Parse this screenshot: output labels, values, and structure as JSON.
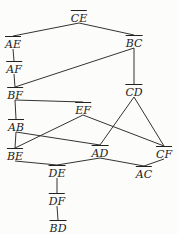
{
  "diagram": {
    "type": "hasse-diagram",
    "nodes": [
      {
        "id": "CE",
        "label": "CE",
        "x": 79,
        "y": 17
      },
      {
        "id": "AE",
        "label": "AE",
        "x": 13,
        "y": 43
      },
      {
        "id": "BC",
        "label": "BC",
        "x": 134,
        "y": 42
      },
      {
        "id": "AF",
        "label": "AF",
        "x": 14,
        "y": 68
      },
      {
        "id": "BF",
        "label": "BF",
        "x": 15,
        "y": 94
      },
      {
        "id": "CD",
        "label": "CD",
        "x": 134,
        "y": 91
      },
      {
        "id": "EF",
        "label": "EF",
        "x": 83,
        "y": 109
      },
      {
        "id": "AB",
        "label": "AB",
        "x": 16,
        "y": 126
      },
      {
        "id": "BE",
        "label": "BE",
        "x": 15,
        "y": 155
      },
      {
        "id": "AD",
        "label": "AD",
        "x": 100,
        "y": 152
      },
      {
        "id": "CF",
        "label": "CF",
        "x": 164,
        "y": 153
      },
      {
        "id": "DE",
        "label": "DE",
        "x": 57,
        "y": 172
      },
      {
        "id": "AC",
        "label": "AC",
        "x": 144,
        "y": 173
      },
      {
        "id": "DF",
        "label": "DF",
        "x": 57,
        "y": 200
      },
      {
        "id": "BD",
        "label": "BD",
        "x": 58,
        "y": 227
      }
    ],
    "edges": [
      [
        "CE",
        "AE"
      ],
      [
        "CE",
        "BC"
      ],
      [
        "AE",
        "AF"
      ],
      [
        "AF",
        "BF"
      ],
      [
        "BC",
        "BF"
      ],
      [
        "BC",
        "CD"
      ],
      [
        "BF",
        "AB"
      ],
      [
        "BF",
        "EF"
      ],
      [
        "EF",
        "BE"
      ],
      [
        "EF",
        "CF"
      ],
      [
        "AB",
        "BE"
      ],
      [
        "AB",
        "AD"
      ],
      [
        "CD",
        "AD"
      ],
      [
        "CD",
        "CF"
      ],
      [
        "BE",
        "DE"
      ],
      [
        "AD",
        "DE"
      ],
      [
        "AD",
        "AC"
      ],
      [
        "CF",
        "AC"
      ],
      [
        "DE",
        "DF"
      ],
      [
        "DF",
        "BD"
      ]
    ]
  }
}
